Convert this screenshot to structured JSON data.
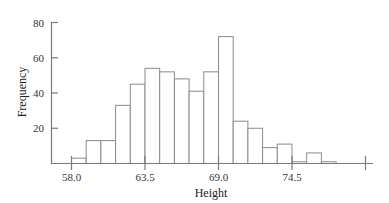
{
  "chart_data": {
    "type": "bar",
    "subtype": "histogram",
    "title": "",
    "xlabel": "Height",
    "ylabel": "Frequency",
    "ylim": [
      0,
      80
    ],
    "yticks": [
      20,
      40,
      60,
      80
    ],
    "ytick_labels": [
      "20",
      "40",
      "60",
      "80"
    ],
    "xticks": [
      58.0,
      63.5,
      69.0,
      74.5,
      80.0
    ],
    "xtick_labels": [
      "58.0",
      "63.5",
      "69.0",
      "74.5",
      ""
    ],
    "xlim": [
      55.1,
      80.9
    ],
    "bin_start": 58.0,
    "bin_width": 1.1,
    "bin_edges": [
      58.0,
      59.1,
      60.2,
      61.3,
      62.4,
      63.5,
      64.6,
      65.7,
      66.8,
      67.9,
      69.0,
      70.1,
      71.2,
      72.3,
      73.4,
      74.5,
      75.6,
      76.7,
      77.8
    ],
    "values": [
      3,
      13,
      13,
      33,
      45,
      54,
      52,
      48,
      41,
      52,
      72,
      24,
      20,
      9,
      11,
      1,
      6,
      1
    ],
    "grid": false,
    "legend": null,
    "bar_fill": "#ffffff",
    "bar_stroke": "#8a8a8a",
    "axis_color": "#7a7a7a"
  }
}
